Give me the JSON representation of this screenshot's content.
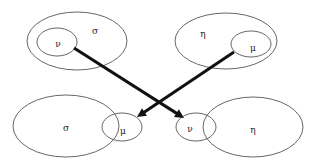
{
  "diagram": {
    "groups": [
      {
        "id": "top-left",
        "outer": {
          "label": "σ",
          "cx": 77,
          "cy": 41,
          "rx": 50,
          "ry": 29,
          "label_x": 95,
          "label_y": 31
        },
        "inner": {
          "label": "ν",
          "cx": 57,
          "cy": 42,
          "rx": 20,
          "ry": 14,
          "label_x": 58,
          "label_y": 44
        }
      },
      {
        "id": "top-right",
        "outer": {
          "label": "η",
          "cx": 226,
          "cy": 41,
          "rx": 51,
          "ry": 28,
          "label_x": 203,
          "label_y": 34
        },
        "inner": {
          "label": "μ",
          "cx": 251,
          "cy": 44,
          "rx": 20,
          "ry": 13,
          "label_x": 253,
          "label_y": 48
        }
      },
      {
        "id": "bottom-left",
        "main": {
          "label": "σ",
          "cx": 66,
          "cy": 126,
          "rx": 53,
          "ry": 31,
          "label_x": 66,
          "label_y": 128
        },
        "overlap": {
          "label": "μ",
          "cx": 122,
          "cy": 127,
          "rx": 20,
          "ry": 14,
          "label_x": 123,
          "label_y": 131
        }
      },
      {
        "id": "bottom-right",
        "overlap": {
          "label": "ν",
          "cx": 196,
          "cy": 127,
          "rx": 20,
          "ry": 14,
          "label_x": 190,
          "label_y": 129
        },
        "main": {
          "label": "η",
          "cx": 253,
          "cy": 127,
          "rx": 50,
          "ry": 30,
          "label_x": 253,
          "label_y": 130
        }
      }
    ],
    "arrows": [
      {
        "from": "top-left ν",
        "to": "bottom-right ν",
        "x1": 74,
        "y1": 48,
        "x2": 184,
        "y2": 118
      },
      {
        "from": "top-right μ",
        "to": "bottom-left μ",
        "x1": 234,
        "y1": 52,
        "x2": 137,
        "y2": 117
      }
    ],
    "colors": {
      "outline": "#555555",
      "arrow": "#111111",
      "text": "#222222",
      "background": "#ffffff"
    }
  }
}
